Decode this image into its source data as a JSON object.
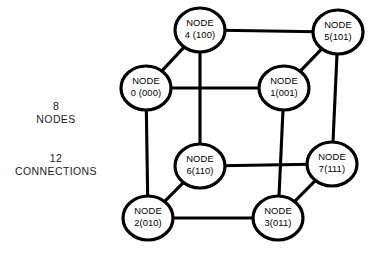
{
  "figure": {
    "background_color": "#ffffff",
    "line_color": "#000000",
    "node_fill_color": "#ffffff"
  },
  "caption": {
    "nodes": {
      "count": "8",
      "word": "NODES"
    },
    "connections": {
      "count": "12",
      "word": "CONNECTIONS"
    }
  },
  "chart_data": {
    "type": "diagram",
    "subtype": "node-link-graph",
    "node_count": 8,
    "edge_count": 12,
    "nodes": [
      {
        "id": "node-0",
        "label_line1": "NODE",
        "label_line2": "0 (000)",
        "number": 0,
        "binary": "000",
        "cx": 146,
        "cy": 88,
        "rx": 25,
        "ry": 22
      },
      {
        "id": "node-1",
        "label_line1": "NODE",
        "label_line2": "1(001)",
        "number": 1,
        "binary": "001",
        "cx": 284,
        "cy": 88,
        "rx": 25,
        "ry": 22
      },
      {
        "id": "node-2",
        "label_line1": "NODE",
        "label_line2": "2(010)",
        "number": 2,
        "binary": "010",
        "cx": 148,
        "cy": 218,
        "rx": 25,
        "ry": 22
      },
      {
        "id": "node-3",
        "label_line1": "NODE",
        "label_line2": "3(011)",
        "number": 3,
        "binary": "011",
        "cx": 278,
        "cy": 218,
        "rx": 25,
        "ry": 22
      },
      {
        "id": "node-4",
        "label_line1": "NODE",
        "label_line2": "4 (100)",
        "number": 4,
        "binary": "100",
        "cx": 200,
        "cy": 30,
        "rx": 25,
        "ry": 22
      },
      {
        "id": "node-5",
        "label_line1": "NODE",
        "label_line2": "5(101)",
        "number": 5,
        "binary": "101",
        "cx": 338,
        "cy": 32,
        "rx": 25,
        "ry": 22
      },
      {
        "id": "node-6",
        "label_line1": "NODE",
        "label_line2": "6(110)",
        "number": 6,
        "binary": "110",
        "cx": 200,
        "cy": 166,
        "rx": 25,
        "ry": 22
      },
      {
        "id": "node-7",
        "label_line1": "NODE",
        "label_line2": "7(111)",
        "number": 7,
        "binary": "111",
        "cx": 332,
        "cy": 164,
        "rx": 25,
        "ry": 22
      }
    ],
    "edges": [
      {
        "id": "edge-0-1",
        "from": "node-0",
        "to": "node-1",
        "kind": "horizontal"
      },
      {
        "id": "edge-0-2",
        "from": "node-0",
        "to": "node-2",
        "kind": "vertical"
      },
      {
        "id": "edge-0-4",
        "from": "node-0",
        "to": "node-4",
        "kind": "diagonal"
      },
      {
        "id": "edge-1-3",
        "from": "node-1",
        "to": "node-3",
        "kind": "vertical"
      },
      {
        "id": "edge-1-5",
        "from": "node-1",
        "to": "node-5",
        "kind": "diagonal"
      },
      {
        "id": "edge-2-3",
        "from": "node-2",
        "to": "node-3",
        "kind": "horizontal"
      },
      {
        "id": "edge-2-6",
        "from": "node-2",
        "to": "node-6",
        "kind": "diagonal"
      },
      {
        "id": "edge-3-7",
        "from": "node-3",
        "to": "node-7",
        "kind": "diagonal"
      },
      {
        "id": "edge-4-5",
        "from": "node-4",
        "to": "node-5",
        "kind": "horizontal"
      },
      {
        "id": "edge-4-6",
        "from": "node-4",
        "to": "node-6",
        "kind": "vertical"
      },
      {
        "id": "edge-5-7",
        "from": "node-5",
        "to": "node-7",
        "kind": "vertical"
      },
      {
        "id": "edge-6-7",
        "from": "node-6",
        "to": "node-7",
        "kind": "horizontal"
      }
    ]
  }
}
